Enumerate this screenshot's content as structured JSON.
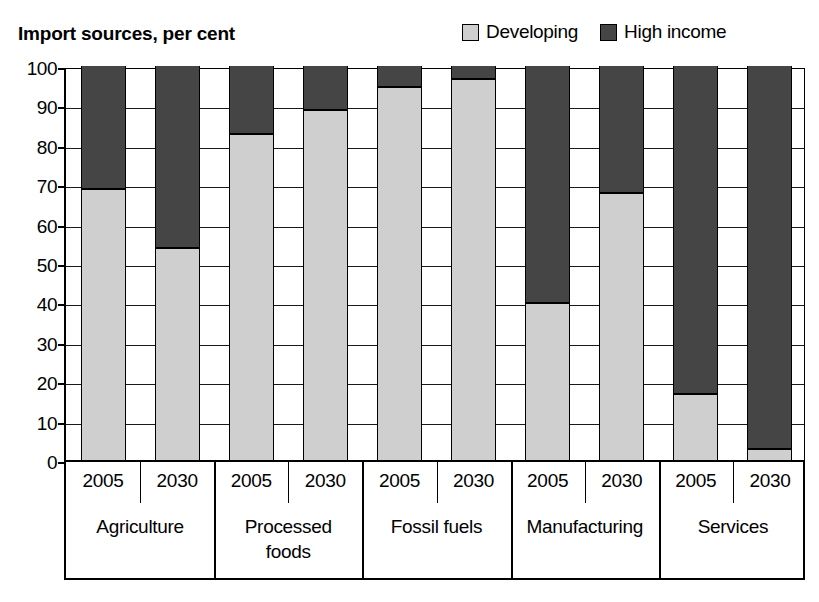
{
  "header": {
    "title": "Import sources, per cent"
  },
  "legend": {
    "position": "top-right",
    "entries": [
      {
        "label": "Developing",
        "color": "#cfcfcf",
        "swatch": "legend-swatch-developing"
      },
      {
        "label": "High income",
        "color": "#454545",
        "swatch": "legend-swatch-high-income"
      }
    ]
  },
  "axes": {
    "y_ticks": [
      "100",
      "90",
      "80",
      "70",
      "60",
      "50",
      "40",
      "30",
      "20",
      "10",
      "0"
    ]
  },
  "chart_data": {
    "type": "bar",
    "subtype": "stacked-column",
    "title": "Import sources, per cent",
    "xlabel": "",
    "ylabel": "",
    "ylim": [
      0,
      100
    ],
    "ytick_step": 10,
    "grid": true,
    "legend_position": "top-right",
    "categories": [
      "Agriculture",
      "Agriculture",
      "Processed foods",
      "Processed foods",
      "Fossil fuels",
      "Fossil fuels",
      "Manufacturing",
      "Manufacturing",
      "Services",
      "Services"
    ],
    "groups": [
      {
        "name": "Agriculture",
        "display": "Agriculture",
        "years": [
          "2005",
          "2030"
        ]
      },
      {
        "name": "Processed foods",
        "display": "Processed\nfoods",
        "years": [
          "2005",
          "2030"
        ]
      },
      {
        "name": "Fossil fuels",
        "display": "Fossil fuels",
        "years": [
          "2005",
          "2030"
        ]
      },
      {
        "name": "Manufacturing",
        "display": "Manufacturing",
        "years": [
          "2005",
          "2030"
        ]
      },
      {
        "name": "Services",
        "display": "Services",
        "years": [
          "2005",
          "2030"
        ]
      }
    ],
    "x": [
      "2005",
      "2030",
      "2005",
      "2030",
      "2005",
      "2030",
      "2005",
      "2030",
      "2005",
      "2030"
    ],
    "series": [
      {
        "name": "Developing",
        "color": "#cfcfcf",
        "values": [
          69,
          54,
          83,
          89,
          95,
          97,
          40,
          68,
          17,
          3
        ]
      },
      {
        "name": "High income",
        "color": "#454545",
        "values": [
          31,
          46,
          17,
          11,
          5,
          3,
          60,
          32,
          83,
          97
        ]
      }
    ],
    "bars": [
      {
        "group": "Agriculture",
        "year": "2005",
        "developing": 69,
        "high_income": 31
      },
      {
        "group": "Agriculture",
        "year": "2030",
        "developing": 54,
        "high_income": 46
      },
      {
        "group": "Processed foods",
        "year": "2005",
        "developing": 83,
        "high_income": 17
      },
      {
        "group": "Processed foods",
        "year": "2030",
        "developing": 89,
        "high_income": 11
      },
      {
        "group": "Fossil fuels",
        "year": "2005",
        "developing": 95,
        "high_income": 5
      },
      {
        "group": "Fossil fuels",
        "year": "2030",
        "developing": 97,
        "high_income": 3
      },
      {
        "group": "Manufacturing",
        "year": "2005",
        "developing": 40,
        "high_income": 60
      },
      {
        "group": "Manufacturing",
        "year": "2030",
        "developing": 68,
        "high_income": 32
      },
      {
        "group": "Services",
        "year": "2005",
        "developing": 17,
        "high_income": 83
      },
      {
        "group": "Services",
        "year": "2030",
        "developing": 3,
        "high_income": 97
      }
    ]
  }
}
